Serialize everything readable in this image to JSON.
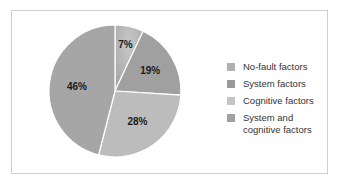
{
  "chart_data": {
    "type": "pie",
    "title": "",
    "categories": [
      "No-fault factors",
      "System factors",
      "Cognitive factors",
      "System and cognitive factors"
    ],
    "values": [
      7,
      19,
      28,
      46
    ],
    "labels": [
      "7%",
      "19%",
      "28%",
      "46%"
    ],
    "colors": [
      "#b3b3b3",
      "#a0a0a0",
      "#bcbcbc",
      "#a6a6a6"
    ],
    "legend_position": "right"
  },
  "legend": {
    "items": [
      {
        "label": "No-fault factors",
        "color": "#b0b0b0"
      },
      {
        "label": "System factors",
        "color": "#9a9a9a"
      },
      {
        "label": "Cognitive factors",
        "color": "#c4c4c4"
      },
      {
        "label": "System and cognitive factors",
        "color": "#a2a2a2"
      }
    ]
  }
}
